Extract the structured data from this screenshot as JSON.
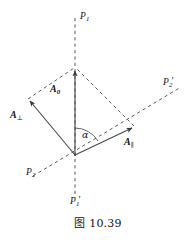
{
  "figure": {
    "caption": "图 10.39",
    "caption_number": "10.39",
    "caption_prefix": "图"
  },
  "colors": {
    "background": "#ffffff",
    "line": "#3c3c3c",
    "dashed_line": "#555555",
    "vector_line": "#4a4a4a",
    "text": "#141414"
  },
  "axes": [
    {
      "id": "axis-p1",
      "name": "vertical-plane-axis",
      "label_top": "P",
      "label_top_sub": "1",
      "label_top_prime": "",
      "label_bottom": "P",
      "label_bottom_sub": "1",
      "label_bottom_prime": "′",
      "style": "dashed"
    },
    {
      "id": "axis-p2",
      "name": "diagonal-plane-axis",
      "label_lower_left": "P",
      "label_lower_left_sub": "2",
      "label_lower_left_prime": "",
      "label_upper_right": "P",
      "label_upper_right_sub": "2",
      "label_upper_right_prime": "′",
      "style": "dashed"
    }
  ],
  "vectors": [
    {
      "id": "vector-a0",
      "name": "resultant-vector",
      "symbol": "A",
      "subscript": "0",
      "subscript_kind": "numeric",
      "style": "solid",
      "direction": "up"
    },
    {
      "id": "vector-a-perp",
      "name": "perpendicular-component-vector",
      "symbol": "A",
      "subscript": "⊥",
      "subscript_kind": "symbol",
      "style": "solid",
      "direction": "up-left"
    },
    {
      "id": "vector-a-parallel",
      "name": "parallel-component-vector",
      "symbol": "A",
      "subscript": "∥",
      "subscript_kind": "symbol",
      "style": "solid",
      "direction": "up-right"
    }
  ],
  "angle": {
    "id": "angle-alpha",
    "name": "alpha-angle",
    "symbol": "α",
    "between": [
      "vector-a0",
      "vector-a-parallel"
    ]
  },
  "construction": {
    "parallelogram_sides": "dashed",
    "note_left_side": "from A-perp tip to A0 tip",
    "note_right_side": "from A-parallel tip to A0 tip"
  }
}
